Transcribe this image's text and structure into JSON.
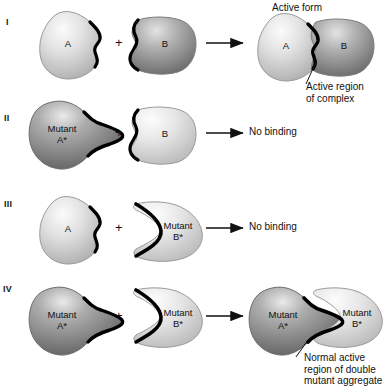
{
  "figure": {
    "title_annotations": {
      "active_form": "Active form",
      "active_region_complex": "Active region\nof complex",
      "normal_active_region": "Normal active\nregion of double\nmutant aggregate"
    },
    "plus_symbol": "+",
    "rows": [
      {
        "numeral": "I",
        "left_protein": "A",
        "right_protein": "B",
        "result_type": "complex",
        "result_label": "",
        "complex_left": "A",
        "complex_right": "B",
        "annotation_top": "Active form",
        "annotation_bottom": "Active region\nof complex"
      },
      {
        "numeral": "II",
        "left_protein": "Mutant\nA*",
        "right_protein": "B",
        "result_type": "text",
        "result_label": "No binding",
        "complex_left": "",
        "complex_right": "",
        "annotation_top": "",
        "annotation_bottom": ""
      },
      {
        "numeral": "III",
        "left_protein": "A",
        "right_protein": "Mutant\nB*",
        "result_type": "text",
        "result_label": "No binding",
        "complex_left": "",
        "complex_right": "",
        "annotation_top": "",
        "annotation_bottom": ""
      },
      {
        "numeral": "IV",
        "left_protein": "Mutant\nA*",
        "right_protein": "Mutant\nB*",
        "result_type": "complex",
        "result_label": "",
        "complex_left": "Mutant\nA*",
        "complex_right": "Mutant\nB*",
        "annotation_top": "",
        "annotation_bottom": "Normal active\nregion of double\nmutant aggregate"
      }
    ],
    "colors": {
      "light_protein_light": "#f3f3f3",
      "light_protein_dark": "#b9b9b9",
      "dark_protein_light": "#d8d8d8",
      "dark_protein_dark": "#6f6f6f",
      "outline_thick": "#000000",
      "outline_thin": "#8a8a8a",
      "text": "#111111",
      "background": "#ffffff"
    }
  }
}
